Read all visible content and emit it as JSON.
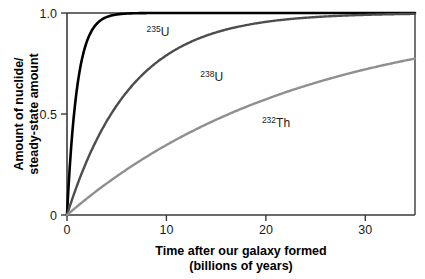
{
  "figure": {
    "background": "#ffffff",
    "plot_area": {
      "left": 67,
      "top": 13,
      "right": 415,
      "bottom": 215
    }
  },
  "chart_data": {
    "type": "line",
    "title": "",
    "subtitle": "",
    "xlabel": "Time after our galaxy formed",
    "xlabel_line2": "(billions of years)",
    "ylabel": "Amount of nuclide/",
    "ylabel_line2": "steady-state amount",
    "xlim": [
      0,
      35
    ],
    "ylim": [
      0,
      1.0
    ],
    "xticks": [
      0,
      10,
      20,
      30
    ],
    "xticklabels": [
      "0",
      "10",
      "20",
      "30"
    ],
    "yticks": [
      0,
      0.5,
      1.0
    ],
    "yticklabels": [
      "0",
      "0.5",
      "1.0"
    ],
    "grid": false,
    "legend": "inline-annotations",
    "frame": "box",
    "model": "saturation growth: y = 1 - exp(-t / tau)",
    "series": [
      {
        "name": "235U",
        "label_sup": "235",
        "label_base": "U",
        "color": "#000000",
        "width": 2.6,
        "tau": 1.02,
        "scale": 1.0,
        "label_x": 8.0,
        "label_y": 0.885,
        "x": [
          0,
          0.5,
          1,
          1.5,
          2,
          2.5,
          3,
          3.5,
          4,
          5,
          6,
          7,
          8,
          10,
          12,
          15,
          20,
          25,
          30,
          35
        ],
        "y": [
          0.0,
          0.387,
          0.624,
          0.769,
          0.858,
          0.913,
          0.947,
          0.968,
          0.98,
          0.993,
          0.997,
          0.999,
          0.9996,
          0.9999,
          1.0,
          1.0,
          1.0,
          1.0,
          1.0,
          1.0
        ]
      },
      {
        "name": "238U",
        "label_sup": "238",
        "label_base": "U",
        "color": "#4d4d4d",
        "width": 2.4,
        "tau": 6.4,
        "scale": 1.0,
        "label_x": 13.4,
        "label_y": 0.662,
        "x": [
          0,
          1,
          2,
          3,
          4,
          5,
          6,
          8,
          10,
          12,
          14,
          16,
          18,
          20,
          24,
          28,
          32,
          35
        ],
        "y": [
          0.0,
          0.145,
          0.269,
          0.375,
          0.465,
          0.543,
          0.609,
          0.714,
          0.791,
          0.847,
          0.888,
          0.918,
          0.94,
          0.956,
          0.977,
          0.988,
          0.994,
          0.996
        ]
      },
      {
        "name": "232Th",
        "label_sup": "232",
        "label_base": "Th",
        "color": "#8f8f8f",
        "width": 2.4,
        "tau": 23.5,
        "scale": 1.0,
        "label_x": 19.6,
        "label_y": 0.437,
        "x": [
          0,
          2,
          4,
          6,
          8,
          10,
          12,
          14,
          16,
          18,
          20,
          23,
          26,
          29,
          32,
          35
        ],
        "y": [
          0.0,
          0.0815,
          0.1563,
          0.225,
          0.2881,
          0.3461,
          0.3993,
          0.4482,
          0.4931,
          0.5343,
          0.5722,
          0.6222,
          0.6661,
          0.7046,
          0.7383,
          0.768
        ]
      }
    ]
  },
  "axis_titles": {
    "x_line1": "Time after our galaxy formed",
    "x_line2": "(billions of years)",
    "y_line1": "Amount of nuclide/",
    "y_line2": "steady-state amount"
  }
}
